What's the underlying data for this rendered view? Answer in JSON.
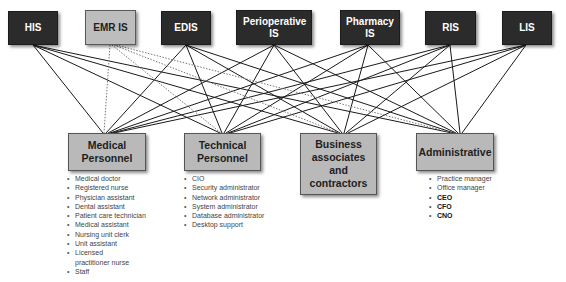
{
  "systems": [
    {
      "id": "his",
      "label": "HIS",
      "style": "dark"
    },
    {
      "id": "emr",
      "label": "EMR IS",
      "style": "light"
    },
    {
      "id": "edis",
      "label": "EDIS",
      "style": "dark"
    },
    {
      "id": "periop",
      "label": "Perioperative IS",
      "style": "dark"
    },
    {
      "id": "pharmacy",
      "label": "Pharmacy IS",
      "style": "dark"
    },
    {
      "id": "ris",
      "label": "RIS",
      "style": "dark"
    },
    {
      "id": "lis",
      "label": "LIS",
      "style": "dark"
    }
  ],
  "roles": [
    {
      "id": "medical",
      "label": "Medical Personnel",
      "items": [
        {
          "text": "Medical doctor"
        },
        {
          "text": "Registered nurse"
        },
        {
          "text": "Physician assistant"
        },
        {
          "text": "Dental assistant"
        },
        {
          "text": "Patient care technician"
        },
        {
          "text": "Medical assistant"
        },
        {
          "text": "Nursing unit clerk"
        },
        {
          "text": "Unit assistant"
        },
        {
          "text": "Licensed practitioner nurse"
        },
        {
          "text": "Staff"
        }
      ]
    },
    {
      "id": "technical",
      "label": "Technical Personnel",
      "items": [
        {
          "text": "CIO"
        },
        {
          "text": "Security administrator"
        },
        {
          "text": "Network administrator"
        },
        {
          "text": "System administrator"
        },
        {
          "text": "Database administrator"
        },
        {
          "text": "Desktop support"
        }
      ]
    },
    {
      "id": "business",
      "label": "Business associates and contractors",
      "items": []
    },
    {
      "id": "administrative",
      "label": "Administrative",
      "items": [
        {
          "text": "Practice manager",
          "emphasis": false
        },
        {
          "text": "Office manager",
          "emphasis": false
        },
        {
          "text": "CEO",
          "emphasis": true
        },
        {
          "text": "CFO",
          "emphasis": true
        },
        {
          "text": "CNO",
          "emphasis": true
        }
      ]
    }
  ],
  "connections": {
    "description": "Every system connects to every role group; EMR IS connections drawn dotted",
    "solid_color": "#1a1a1a",
    "dotted_color": "#777777",
    "dotted_source": "emr"
  },
  "colors": {
    "system_dark": "#2b2b2b",
    "system_light": "#bdbdbd",
    "role_fill": "#b9b9b9",
    "background": "#ffffff"
  }
}
